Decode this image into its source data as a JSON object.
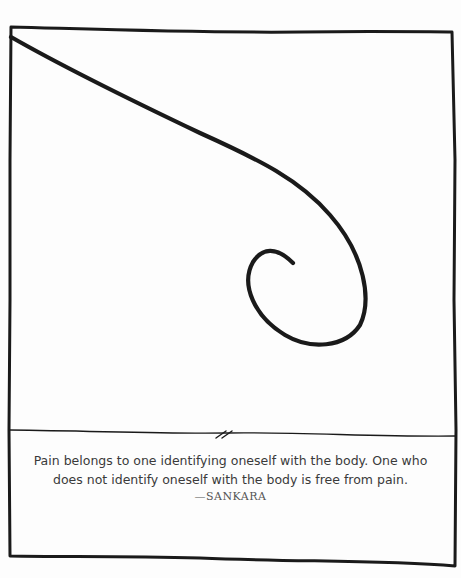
{
  "illustration": {
    "description": "Hand-drawn frame with a curving line ending in a spiral",
    "stroke_color": "#1a1a1a"
  },
  "quote": {
    "line1": "Pain belongs to one identifying oneself with the body. One who",
    "line2": "does not identify oneself with the body is free from pain.",
    "attribution": "—SANKARA"
  }
}
